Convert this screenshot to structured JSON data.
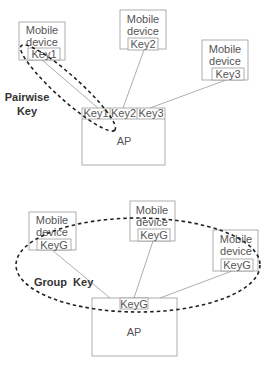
{
  "pairwise": {
    "label_line1": "Pairwise",
    "label_line2": "Key",
    "devices": [
      {
        "line1": "Mobile",
        "line2": "device",
        "key": "Key1"
      },
      {
        "line1": "Mobile",
        "line2": "device",
        "key": "Key2"
      },
      {
        "line1": "Mobile",
        "line2": "device",
        "key": "Key3"
      }
    ],
    "ap": {
      "label": "AP",
      "keys": [
        "Key1",
        "Key2",
        "Key3"
      ]
    }
  },
  "group": {
    "label": "Group  Key",
    "devices": [
      {
        "line1": "Mobile",
        "line2": "device",
        "key": "KeyG"
      },
      {
        "line1": "Mobile",
        "line2": "device",
        "key": "KeyG"
      },
      {
        "line1": "Mobile",
        "line2": "device",
        "key": "KeyG"
      }
    ],
    "ap": {
      "label": "AP",
      "key": "KeyG"
    }
  }
}
